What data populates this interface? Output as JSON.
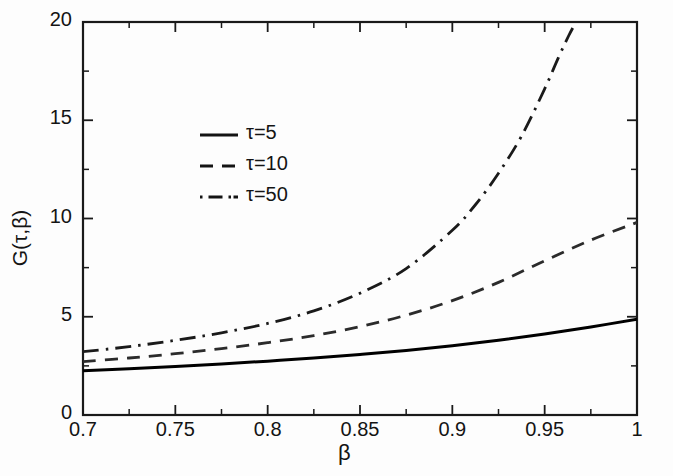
{
  "chart_data": {
    "type": "line",
    "title": "",
    "xlabel": "β",
    "ylabel": "G(τ,β)",
    "xlim": [
      0.7,
      1.0
    ],
    "ylim": [
      0,
      20
    ],
    "xticks": [
      "0.7",
      "0.75",
      "0.8",
      "0.85",
      "0.9",
      "0.95",
      "1"
    ],
    "xtick_values": [
      0.7,
      0.75,
      0.8,
      0.85,
      0.9,
      0.95,
      1.0
    ],
    "yticks": [
      "0",
      "5",
      "10",
      "15",
      "20"
    ],
    "ytick_values": [
      0,
      5,
      10,
      15,
      20
    ],
    "minor_xtick_values": [
      0.725,
      0.775,
      0.825,
      0.875,
      0.925,
      0.975
    ],
    "minor_ytick_values": [
      2.5,
      7.5,
      12.5,
      17.5
    ],
    "grid": false,
    "legend_position": "upper-left-inset",
    "series": [
      {
        "name": "τ=5",
        "style": "solid",
        "color": "#000000",
        "x": [
          0.7,
          0.725,
          0.75,
          0.775,
          0.8,
          0.825,
          0.85,
          0.875,
          0.9,
          0.925,
          0.95,
          0.975,
          1.0
        ],
        "values": [
          2.25,
          2.35,
          2.47,
          2.6,
          2.74,
          2.9,
          3.08,
          3.28,
          3.52,
          3.8,
          4.12,
          4.48,
          4.88
        ]
      },
      {
        "name": "τ=10",
        "style": "dashed",
        "color": "#2b2b2b",
        "x": [
          0.7,
          0.725,
          0.75,
          0.775,
          0.8,
          0.825,
          0.85,
          0.875,
          0.9,
          0.925,
          0.95,
          0.975,
          1.0
        ],
        "values": [
          2.72,
          2.9,
          3.12,
          3.38,
          3.68,
          4.04,
          4.5,
          5.08,
          5.82,
          6.75,
          7.85,
          8.9,
          9.8
        ]
      },
      {
        "name": "τ=50",
        "style": "dashdot",
        "color": "#1a1a1a",
        "x": [
          0.7,
          0.725,
          0.75,
          0.775,
          0.8,
          0.825,
          0.85,
          0.875,
          0.9,
          0.9125,
          0.925,
          0.9375,
          0.95,
          0.9575,
          0.963,
          0.967
        ],
        "values": [
          3.22,
          3.48,
          3.8,
          4.18,
          4.66,
          5.3,
          6.2,
          7.45,
          9.4,
          10.7,
          12.3,
          14.2,
          16.6,
          18.2,
          19.3,
          20.0
        ]
      }
    ],
    "legend": [
      {
        "label": "τ=5",
        "style": "solid"
      },
      {
        "label": "τ=10",
        "style": "dashed"
      },
      {
        "label": "τ=50",
        "style": "dashdot"
      }
    ]
  },
  "figure": {
    "axis_color": "#1a1a1a",
    "background": "#fdfdfd"
  }
}
